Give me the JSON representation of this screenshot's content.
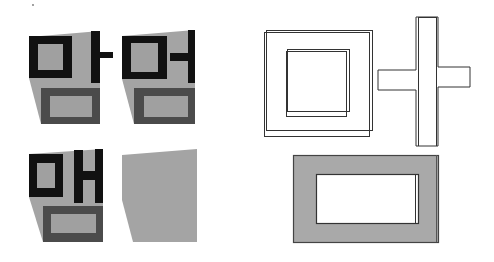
{
  "figure": {
    "width": 494,
    "height": 262,
    "background": "#ffffff",
    "colors": {
      "stroke_black": "#111111",
      "mask_gray": "#a4a4a4",
      "dark_gray": "#4b4b4b",
      "inner_gray": "#a0a0a0",
      "outline": "#333333",
      "frame_fill": "#a9a9a9",
      "white": "#ffffff",
      "dot": "#777777"
    },
    "glyph_panels": [
      {
        "name": "glyph-panel-mam",
        "mask": "29,37 100,31 100,124 41,124 29,78",
        "rects": [
          {
            "name": "initial-square-outer",
            "x": 29,
            "y": 36,
            "w": 43,
            "h": 42,
            "fill": "stroke_black"
          },
          {
            "name": "initial-square-inner",
            "x": 38,
            "y": 44,
            "w": 25,
            "h": 26,
            "fill": "inner_gray"
          },
          {
            "name": "vowel-vertical-bar",
            "x": 91,
            "y": 31,
            "w": 9,
            "h": 52,
            "fill": "stroke_black"
          },
          {
            "name": "vowel-tick-right",
            "x": 100,
            "y": 52,
            "w": 13,
            "h": 6,
            "fill": "stroke_black"
          },
          {
            "name": "final-square-outer",
            "x": 41,
            "y": 88,
            "w": 59,
            "h": 36,
            "fill": "dark_gray"
          },
          {
            "name": "final-square-inner",
            "x": 50,
            "y": 96,
            "w": 42,
            "h": 21,
            "fill": "inner_gray"
          }
        ]
      },
      {
        "name": "glyph-panel-meom",
        "mask": "122,36 195,30 195,124 134,124 122,79",
        "rects": [
          {
            "name": "initial-square-outer",
            "x": 122,
            "y": 36,
            "w": 45,
            "h": 43,
            "fill": "stroke_black"
          },
          {
            "name": "initial-square-inner",
            "x": 131,
            "y": 43,
            "w": 27,
            "h": 29,
            "fill": "inner_gray"
          },
          {
            "name": "vowel-tick-left",
            "x": 170,
            "y": 53,
            "w": 18,
            "h": 8,
            "fill": "stroke_black"
          },
          {
            "name": "vowel-vertical-bar",
            "x": 188,
            "y": 30,
            "w": 7,
            "h": 53,
            "fill": "stroke_black"
          },
          {
            "name": "final-square-outer",
            "x": 134,
            "y": 88,
            "w": 61,
            "h": 36,
            "fill": "dark_gray"
          },
          {
            "name": "final-square-inner",
            "x": 144,
            "y": 96,
            "w": 44,
            "h": 21,
            "fill": "inner_gray"
          }
        ]
      },
      {
        "name": "glyph-panel-maem",
        "mask": "29,154 103,149 103,242 43,242 29,197",
        "rects": [
          {
            "name": "initial-square-outer",
            "x": 29,
            "y": 154,
            "w": 34,
            "h": 43,
            "fill": "stroke_black"
          },
          {
            "name": "initial-square-inner",
            "x": 37,
            "y": 163,
            "w": 18,
            "h": 25,
            "fill": "inner_gray"
          },
          {
            "name": "vowel-left-bar",
            "x": 74,
            "y": 150,
            "w": 9,
            "h": 53,
            "fill": "stroke_black"
          },
          {
            "name": "vowel-right-bar",
            "x": 95,
            "y": 149,
            "w": 8,
            "h": 54,
            "fill": "stroke_black"
          },
          {
            "name": "vowel-crossbar",
            "x": 83,
            "y": 171,
            "w": 12,
            "h": 9,
            "fill": "stroke_black"
          },
          {
            "name": "final-square-outer",
            "x": 43,
            "y": 206,
            "w": 60,
            "h": 36,
            "fill": "dark_gray"
          },
          {
            "name": "final-square-inner",
            "x": 51,
            "y": 214,
            "w": 45,
            "h": 19,
            "fill": "inner_gray"
          }
        ]
      },
      {
        "name": "glyph-panel-mask-only",
        "mask": "122,155 197,149 197,242 133,242 122,200",
        "rects": []
      }
    ],
    "outline_shapes": {
      "square_frame": {
        "outer_a": {
          "x": 266,
          "y": 30,
          "w": 106,
          "h": 100
        },
        "outer_b": {
          "x": 264,
          "y": 32,
          "w": 105,
          "h": 104
        },
        "inner_a": {
          "x": 287,
          "y": 49,
          "w": 62,
          "h": 62
        },
        "inner_b": {
          "x": 286,
          "y": 51,
          "w": 60,
          "h": 65
        }
      },
      "cross": {
        "path": "M416,17 L438,17 L438,67 L470,67 L470,87 L438,87 L438,146 L416,146 L416,90 L378,90 L378,70 L416,70 Z",
        "inner_bar": {
          "x": 418,
          "y": 17,
          "w": 18,
          "h": 129
        }
      },
      "gray_frame": {
        "outer": {
          "x": 293,
          "y": 155,
          "w": 145,
          "h": 87
        },
        "outer_edge_x": 436,
        "inner": {
          "x": 316,
          "y": 174,
          "w": 102,
          "h": 49
        },
        "inner_edge_x": 415
      }
    },
    "dot": {
      "cx": 33,
      "cy": 5,
      "r": 0.9
    }
  }
}
